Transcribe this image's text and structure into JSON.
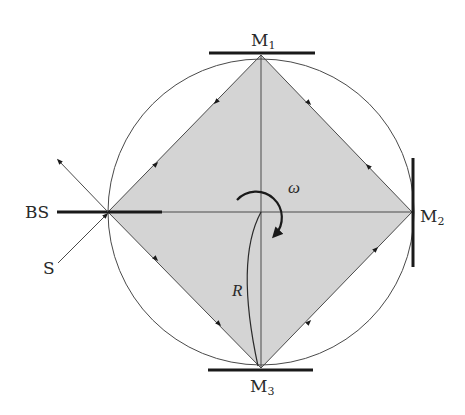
{
  "diagram": {
    "type": "Sagnac ring interferometer schematic",
    "colors": {
      "background": "#ffffff",
      "fill": "#d4d4d4",
      "line": "#4a4a4a",
      "mirror": "#1a1a1a"
    },
    "labels": {
      "m1": "M",
      "m1_sub": "1",
      "m2": "M",
      "m2_sub": "2",
      "m3": "M",
      "m3_sub": "3",
      "beam_splitter": "BS",
      "source": "S",
      "angular_velocity": "ω",
      "radius": "R"
    },
    "components": [
      {
        "id": "M1",
        "role": "mirror",
        "position": "top"
      },
      {
        "id": "M2",
        "role": "mirror",
        "position": "right"
      },
      {
        "id": "M3",
        "role": "mirror",
        "position": "bottom"
      },
      {
        "id": "BS",
        "role": "beam splitter",
        "position": "left"
      },
      {
        "id": "S",
        "role": "light source input",
        "position": "lower-left"
      }
    ],
    "rotation": {
      "symbol": "ω",
      "direction": "clockwise"
    },
    "radius_symbol": "R",
    "caption": ""
  }
}
